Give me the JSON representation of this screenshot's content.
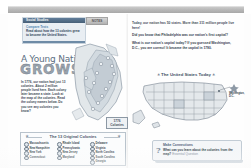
{
  "document": {
    "type": "textbook-spread-scan"
  },
  "toolbar": {
    "band_label": ""
  },
  "left_page": {
    "callout": {
      "title": "Social Studies",
      "link_label": "Compare Texts",
      "text": "Read about how the 13 colonies grew to become the United States.",
      "tab_label": "NOTES"
    },
    "title_line1": "A Young Nation",
    "title_line2": "GROWS",
    "paragraphs": [
      "In 1776, our nation had just 13 colonies. About 2 million people lived here. Each colony later became a state. Look at the map of the colonies. Read the colony names below. Do you see any colonies you know?"
    ],
    "year_box": {
      "year": "1776",
      "label": "Colonies"
    },
    "legend": {
      "title": "The 13 Original Colonies",
      "columns": [
        [
          "Massachusetts",
          "New Hampshire",
          "New York",
          "Connecticut"
        ],
        [
          "Rhode Island",
          "Pennsylvania",
          "New Jersey",
          "Maryland"
        ],
        [
          "Delaware",
          "Virginia",
          "North Carolina",
          "South Carolina",
          "Georgia"
        ]
      ]
    },
    "page_number": "406"
  },
  "right_page": {
    "paragraphs": [
      "Today, our nation has 50 states. More than 311 million people live here!",
      "Did you know that Philadelphia was our nation's first capital?",
      "What is our nation's capital today? If you guessed Washington, D.C., you are correct! It became the capital in 1790."
    ],
    "map": {
      "title": "The United States Today",
      "labels": [
        "Washington, D.C."
      ]
    },
    "connection": {
      "heading": "Make Connections",
      "icon": "question-mark-icon",
      "question": "What can you learn about the colonies from the map?",
      "answer_hint": "Essential Question"
    },
    "page_number": "407"
  },
  "colors": {
    "band": "#a9a9a9",
    "callout_header": "#4f6f8f",
    "link": "#4b7fae",
    "title": "#5c6f82",
    "heading_outline": "#6f7b88"
  }
}
